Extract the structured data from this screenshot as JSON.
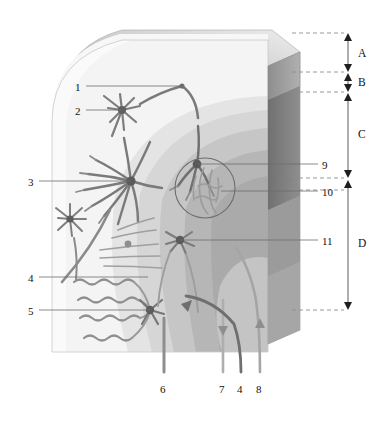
{
  "figure": {
    "kind": "anatomical-cutaway-diagram",
    "background_color": "#ffffff",
    "ink_color": "#1a1a1a",
    "leader_color": "#6d6d6d"
  },
  "layer_brackets": [
    {
      "id": "A",
      "label": "A",
      "y_top": 33,
      "y_bottom": 72,
      "text_y": 48
    },
    {
      "id": "B",
      "label": "B",
      "y_top": 73,
      "y_bottom": 92,
      "text_y": 77
    },
    {
      "id": "C",
      "label": "C",
      "y_top": 93,
      "y_bottom": 178,
      "text_y": 129
    },
    {
      "id": "D",
      "label": "D",
      "y_top": 180,
      "y_bottom": 310,
      "text_y": 238
    }
  ],
  "dashed_guides": [
    {
      "y": 33
    },
    {
      "y": 72
    },
    {
      "y": 92
    },
    {
      "y": 178
    },
    {
      "y": 190
    },
    {
      "y": 310
    }
  ],
  "callouts_left": [
    {
      "number": "1",
      "text_x": 75,
      "text_y": 82,
      "leader_from_x": 86,
      "leader_to_x": 182,
      "leader_y": 86
    },
    {
      "number": "2",
      "text_x": 75,
      "text_y": 106,
      "leader_from_x": 86,
      "leader_to_x": 122,
      "leader_y": 110
    },
    {
      "number": "3",
      "text_x": 28,
      "text_y": 177,
      "leader_from_x": 39,
      "leader_to_x": 131,
      "leader_y": 181
    },
    {
      "number": "4",
      "text_x": 28,
      "text_y": 273,
      "leader_from_x": 39,
      "leader_to_x": 148,
      "leader_y": 277
    },
    {
      "number": "5",
      "text_x": 28,
      "text_y": 306,
      "leader_from_x": 39,
      "leader_to_x": 150,
      "leader_y": 310
    }
  ],
  "callouts_right": [
    {
      "number": "9",
      "text_x": 322,
      "text_y": 160,
      "leader_from_x": 318,
      "leader_to_x": 197,
      "leader_y": 164
    },
    {
      "number": "10",
      "text_x": 322,
      "text_y": 187,
      "leader_from_x": 318,
      "leader_to_x": 221,
      "leader_y": 191
    },
    {
      "number": "11",
      "text_x": 322,
      "text_y": 236,
      "leader_from_x": 318,
      "leader_to_x": 180,
      "leader_y": 240
    }
  ],
  "callouts_bottom": [
    {
      "number": "6",
      "text_x": 160,
      "text_y": 384,
      "fiber_x": 164
    },
    {
      "number": "7",
      "text_x": 219,
      "text_y": 384,
      "fiber_x": 223
    },
    {
      "number": "4",
      "text_x": 237,
      "text_y": 384,
      "fiber_x": 241
    },
    {
      "number": "8",
      "text_x": 256,
      "text_y": 384,
      "fiber_x": 260
    }
  ],
  "palette": {
    "block_top_light": "#f2f2f2",
    "block_top_mid": "#d9d9d9",
    "block_top_dark": "#b3b3b3",
    "face_very_light": "#f6f6f6",
    "face_light": "#e9e9e9",
    "band_1": "#e2e2e2",
    "band_2": "#d2d2d2",
    "band_3": "#c0c0c0",
    "band_4": "#aeaeae",
    "side_face": "#9a9a9a",
    "side_face_dark": "#7e7e7e",
    "neuron_dark": "#6b6b6b",
    "neuron_mid": "#8a8a8a",
    "neuron_light": "#a8a8a8"
  }
}
